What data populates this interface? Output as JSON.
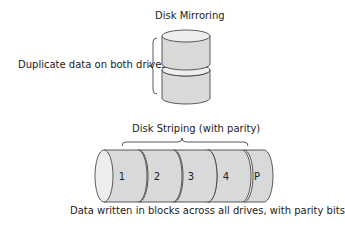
{
  "mirroring": {
    "title": "Disk Mirroring",
    "annotation": "Duplicate data on both drives",
    "drives": 2
  },
  "striping": {
    "title": "Disk Striping (with parity)",
    "caption": "Data written in blocks across all drives, with parity bits",
    "drives": [
      {
        "label": "1"
      },
      {
        "label": "2"
      },
      {
        "label": "3"
      },
      {
        "label": "4"
      },
      {
        "label": "P"
      }
    ]
  },
  "colors": {
    "drive_fill": "#d9d9d9",
    "drive_cap": "#eeeeee",
    "stroke": "#333333",
    "text": "#222222"
  }
}
